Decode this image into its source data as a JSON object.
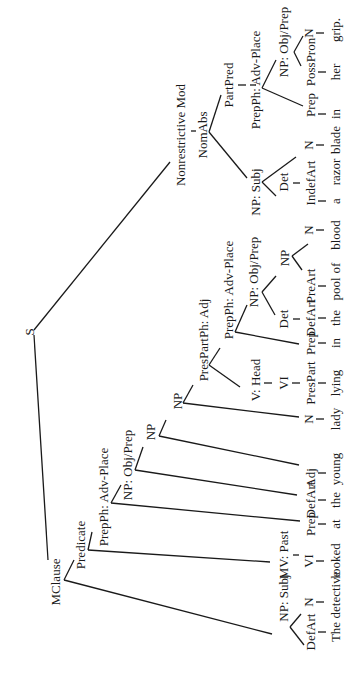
{
  "diagram": {
    "type": "syntax-tree",
    "orientation": "rotated-90-ccw",
    "sentence": "The detective looked at the young lady lying in the pool of blood a razor blade in her grip.",
    "nodes": [
      {
        "id": "S",
        "label": "S",
        "x": 29,
        "y": 332
      },
      {
        "id": "MClause",
        "label": "MClause",
        "x": 55,
        "y": 570
      },
      {
        "id": "Predicate",
        "label": "Predicate",
        "x": 80,
        "y": 545
      },
      {
        "id": "PrepPh1",
        "label": "PrepPh: Adv-Place",
        "x": 103,
        "y": 497
      },
      {
        "id": "NPObj1",
        "label": "NP: Obj/Prep",
        "x": 127,
        "y": 465
      },
      {
        "id": "NP1",
        "label": "NP",
        "x": 150,
        "y": 432
      },
      {
        "id": "NP2",
        "label": "NP",
        "x": 177,
        "y": 401
      },
      {
        "id": "PresPartPh",
        "label": "PresPartPh: Adj",
        "x": 203,
        "y": 340
      },
      {
        "id": "PrepPh2",
        "label": "PrepPh: Adv-Place",
        "x": 228,
        "y": 290
      },
      {
        "id": "NPObj2",
        "label": "NP: Obj/Prep",
        "x": 253,
        "y": 272
      },
      {
        "id": "NP3",
        "label": "NP",
        "x": 284,
        "y": 258
      },
      {
        "id": "NonresMod",
        "label": "Nonrestrictive Mod",
        "x": 180,
        "y": 135
      },
      {
        "id": "NomAbs",
        "label": "NomAbs",
        "x": 202,
        "y": 135
      },
      {
        "id": "NPSubj2",
        "label": "NP: Subj",
        "x": 255,
        "y": 192
      },
      {
        "id": "PartPred",
        "label": "PartPred",
        "x": 228,
        "y": 85
      },
      {
        "id": "PrepPh3",
        "label": "PrepPh: Adv-Place",
        "x": 255,
        "y": 80
      },
      {
        "id": "NPObj3",
        "label": "NP: Obj/Prep",
        "x": 283,
        "y": 42
      },
      {
        "id": "NPSubj1",
        "label": "NP: Subj",
        "x": 283,
        "y": 598
      },
      {
        "id": "MVPast",
        "label": "MV: Past",
        "x": 283,
        "y": 555
      },
      {
        "id": "VHead",
        "label": "V: Head",
        "x": 255,
        "y": 380
      },
      {
        "id": "Det1",
        "label": "Det",
        "x": 283,
        "y": 319
      },
      {
        "id": "Det2",
        "label": "Det",
        "x": 283,
        "y": 182
      }
    ],
    "preterminals": [
      {
        "label": "DefArt",
        "x": 310,
        "y": 632
      },
      {
        "label": "N",
        "x": 308,
        "y": 602
      },
      {
        "label": "VI",
        "x": 308,
        "y": 561
      },
      {
        "label": "Prep",
        "x": 310,
        "y": 524
      },
      {
        "label": "DefArt",
        "x": 310,
        "y": 500
      },
      {
        "label": "Adj",
        "x": 310,
        "y": 481
      },
      {
        "label": "N",
        "x": 308,
        "y": 419
      },
      {
        "label": "VI",
        "x": 283,
        "y": 383
      },
      {
        "label": "PresPart",
        "x": 310,
        "y": 383
      },
      {
        "label": "Prep",
        "x": 310,
        "y": 343
      },
      {
        "label": "DefArt",
        "x": 310,
        "y": 318
      },
      {
        "label": "PreArt",
        "x": 310,
        "y": 286
      },
      {
        "label": "N",
        "x": 308,
        "y": 230
      },
      {
        "label": "IndefArt",
        "x": 310,
        "y": 183
      },
      {
        "label": "N",
        "x": 308,
        "y": 145
      },
      {
        "label": "Prep",
        "x": 310,
        "y": 105
      },
      {
        "label": "PossPron",
        "x": 310,
        "y": 62
      },
      {
        "label": "N",
        "x": 308,
        "y": 33
      }
    ],
    "leaves": [
      {
        "word": "The",
        "x": 335,
        "y": 632
      },
      {
        "word": "detective",
        "x": 335,
        "y": 595
      },
      {
        "word": "looked",
        "x": 335,
        "y": 561
      },
      {
        "word": "at",
        "x": 335,
        "y": 524
      },
      {
        "word": "the",
        "x": 335,
        "y": 500
      },
      {
        "word": "young",
        "x": 335,
        "y": 469
      },
      {
        "word": "lady",
        "x": 335,
        "y": 419
      },
      {
        "word": "lying",
        "x": 335,
        "y": 383
      },
      {
        "word": "in",
        "x": 335,
        "y": 343
      },
      {
        "word": "the",
        "x": 335,
        "y": 318
      },
      {
        "word": "pool",
        "x": 335,
        "y": 289
      },
      {
        "word": "of",
        "x": 335,
        "y": 268
      },
      {
        "word": "blood",
        "x": 335,
        "y": 235
      },
      {
        "word": "a",
        "x": 335,
        "y": 201
      },
      {
        "word": "razor",
        "x": 335,
        "y": 172
      },
      {
        "word": "blade",
        "x": 335,
        "y": 140
      },
      {
        "word": "in",
        "x": 335,
        "y": 114
      },
      {
        "word": "her",
        "x": 335,
        "y": 72
      },
      {
        "word": "grip.",
        "x": 335,
        "y": 30
      }
    ]
  }
}
